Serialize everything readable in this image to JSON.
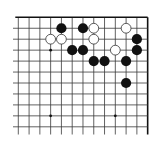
{
  "board": {
    "description": "Partial Go board (upper-right corner region)",
    "columns": 13,
    "rows": 11,
    "origin_x": 18.3,
    "origin_y": 17.3,
    "spacing_x": 10.78,
    "spacing_y": 10.95,
    "top_edge": true,
    "right_edge": true,
    "line_color": "#3a3a3a",
    "edge_color": "#111111",
    "star_points": [
      [
        3,
        3
      ],
      [
        3,
        9
      ],
      [
        9,
        9
      ]
    ],
    "black_stones": [
      [
        4,
        1
      ],
      [
        6,
        1
      ],
      [
        11,
        2
      ],
      [
        5,
        3
      ],
      [
        6,
        3
      ],
      [
        11,
        3
      ],
      [
        7,
        4
      ],
      [
        8,
        4
      ],
      [
        10,
        4
      ],
      [
        10,
        6
      ]
    ],
    "white_stones": [
      [
        7,
        1
      ],
      [
        10,
        1
      ],
      [
        3,
        2
      ],
      [
        4,
        2
      ],
      [
        7,
        2
      ],
      [
        9,
        3
      ]
    ],
    "colors": {
      "black_stone": "#111111",
      "white_stone_fill": "#ffffff",
      "white_stone_stroke": "#333333",
      "background": "#ffffff"
    }
  }
}
